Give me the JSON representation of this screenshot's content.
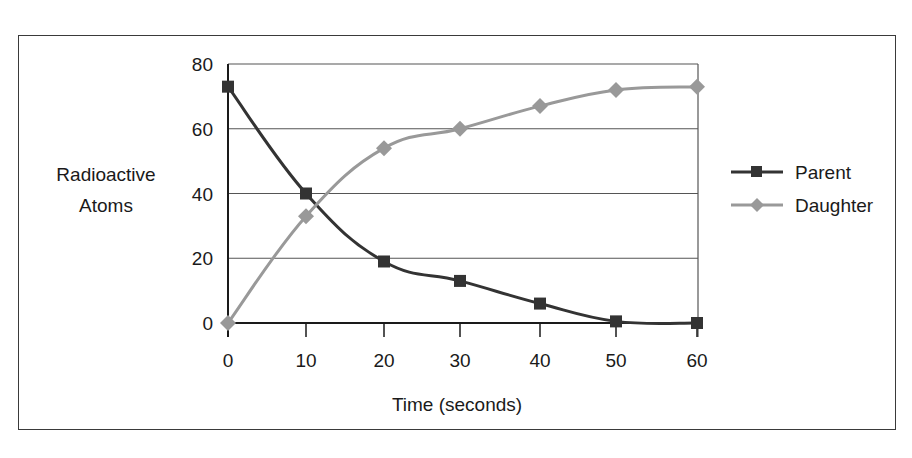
{
  "chart_data": {
    "type": "line",
    "title": "",
    "xlabel": "Time (seconds)",
    "ylabel": "Radioactive Atoms",
    "ylabel_lines": [
      "Radioactive",
      "Atoms"
    ],
    "x": [
      0,
      10,
      20,
      30,
      40,
      50,
      60
    ],
    "x_tick_labels": [
      "0",
      "10",
      "20",
      "30",
      "40",
      "50",
      "60"
    ],
    "y_tick_labels": [
      "0",
      "20",
      "40",
      "60",
      "80"
    ],
    "ylim": [
      0,
      80
    ],
    "xlim": [
      0,
      60
    ],
    "grid": "horizontal",
    "legend_position": "right",
    "series": [
      {
        "name": "Parent",
        "marker": "square",
        "color": "#333333",
        "values": [
          73,
          40,
          19,
          13,
          6,
          0.5,
          0
        ]
      },
      {
        "name": "Daughter",
        "marker": "diamond",
        "color": "#999999",
        "values": [
          0,
          33,
          54,
          60,
          67,
          72,
          73
        ]
      }
    ]
  },
  "legend": {
    "items": [
      {
        "label": "Parent"
      },
      {
        "label": "Daughter"
      }
    ]
  }
}
